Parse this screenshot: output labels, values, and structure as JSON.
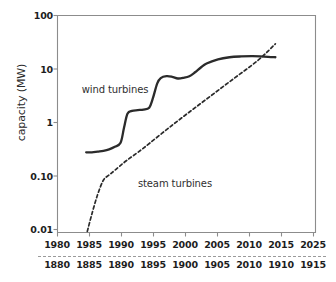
{
  "chart_data": {
    "type": "line",
    "title": "",
    "xlabel": "",
    "ylabel": "capacity (MW)",
    "yscale": "log",
    "ylim": [
      0.01,
      100
    ],
    "ytick_labels": [
      "100",
      "10",
      "1",
      "0.10",
      "0.01"
    ],
    "ytick_values": [
      100,
      10,
      1,
      0.1,
      0.01
    ],
    "xlim": [
      1980,
      2025
    ],
    "xaxis_primary_labels": [
      "1980",
      "1985",
      "1990",
      "1995",
      "2000",
      "2005",
      "2010",
      "2015",
      "2025"
    ],
    "xaxis_secondary_labels": [
      "1880",
      "1885",
      "1890",
      "1895",
      "1900",
      "1905",
      "2010",
      "1910",
      "1915"
    ],
    "grid": false,
    "legend_position": "inline-annotations",
    "annotations": [
      {
        "text": "wind turbines",
        "x": 1990.5,
        "y": 4.0
      },
      {
        "text": "steam turbines",
        "x": 2001.0,
        "y": 0.075
      }
    ],
    "series": [
      {
        "name": "wind turbines",
        "style": "solid",
        "color": "#2b2b2b",
        "x": [
          1985,
          1986,
          1987,
          1988,
          1989,
          1990,
          1991,
          1991.6,
          1992.2,
          1993,
          1994,
          1995,
          1996,
          1996.6,
          1997.4,
          1998,
          1999,
          2000,
          2001,
          2002,
          2003,
          2004,
          2005,
          2006,
          2008,
          2010,
          2012,
          2014,
          2016,
          2018
        ],
        "y": [
          0.3,
          0.3,
          0.31,
          0.32,
          0.34,
          0.38,
          0.45,
          0.85,
          1.55,
          1.75,
          1.8,
          1.85,
          2.0,
          2.9,
          5.6,
          7.0,
          7.6,
          7.4,
          6.9,
          7.1,
          7.6,
          9.0,
          11.0,
          13.0,
          15.5,
          17.0,
          17.6,
          17.8,
          17.5,
          17.0
        ]
      },
      {
        "name": "steam turbines",
        "style": "dashed",
        "color": "#2b2b2b",
        "x": [
          1985.2,
          1986,
          1987,
          1988,
          1989,
          1990,
          1992,
          1995,
          2000,
          2005,
          2010,
          2015,
          2018
        ],
        "y": [
          0.0105,
          0.022,
          0.05,
          0.092,
          0.115,
          0.14,
          0.21,
          0.36,
          0.95,
          2.4,
          6.0,
          15.0,
          30.0
        ]
      }
    ]
  },
  "axes": {
    "y_title": "capacity (MW)",
    "yticks": [
      {
        "label": "100",
        "top": 15
      },
      {
        "label": "10",
        "top": 68.5
      },
      {
        "label": "1",
        "top": 122
      },
      {
        "label": "0.10",
        "top": 175.5
      },
      {
        "label": "0.01",
        "top": 229
      },
      {
        "label": "",
        "top": -100
      }
    ],
    "xticks_top": [
      {
        "label": "1980",
        "left": 57
      },
      {
        "label": "1985",
        "left": 89
      },
      {
        "label": "1990",
        "left": 121
      },
      {
        "label": "1995",
        "left": 153
      },
      {
        "label": "2000",
        "left": 185
      },
      {
        "label": "2005",
        "left": 217
      },
      {
        "label": "2010",
        "left": 249
      },
      {
        "label": "2015",
        "left": 281
      },
      {
        "label": "2025",
        "left": 313
      }
    ],
    "xticks_bottom": [
      {
        "label": "1880",
        "left": 57
      },
      {
        "label": "1885",
        "left": 89
      },
      {
        "label": "1890",
        "left": 121
      },
      {
        "label": "1895",
        "left": 153
      },
      {
        "label": "1900",
        "left": 185
      },
      {
        "label": "1905",
        "left": 217
      },
      {
        "label": "2010",
        "left": 249
      },
      {
        "label": "1910",
        "left": 281
      },
      {
        "label": "1915",
        "left": 313
      }
    ]
  },
  "annotations": {
    "wind": "wind turbines",
    "steam": "steam turbines"
  },
  "colors": {
    "line": "#2b2b2b",
    "frame": "#8c8c8c",
    "text": "#1d1d1d"
  }
}
